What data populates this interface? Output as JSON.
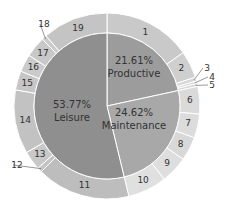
{
  "chart_data": {
    "type": "pie",
    "subtype": "nested-donut",
    "title": "",
    "inner": {
      "labels": [
        "Productive",
        "Maintenance",
        "Leisure"
      ],
      "values": [
        21.61,
        24.62,
        53.77
      ],
      "display": [
        "21.61%",
        "24.62%",
        "53.77%"
      ],
      "colors": [
        "#9c9c9c",
        "#a8a8a8",
        "#8f8f8f"
      ]
    },
    "outer": {
      "labels": [
        "1",
        "2",
        "3",
        "4",
        "5",
        "6",
        "7",
        "8",
        "9",
        "10",
        "11",
        "12",
        "13",
        "14",
        "15",
        "16",
        "17",
        "18",
        "19"
      ],
      "start_deg": [
        0,
        55,
        72,
        74.5,
        76,
        77.8,
        95,
        110,
        125,
        142,
        166.4,
        225,
        228,
        240,
        280,
        292,
        303,
        316,
        319
      ],
      "end_deg": [
        55,
        72,
        74.5,
        76,
        77.8,
        95,
        110,
        125,
        142,
        166.4,
        225,
        228,
        240,
        280,
        292,
        303,
        316,
        319,
        360
      ],
      "colors": [
        "#c9c9c9",
        "#cfcfcf",
        "#d6d6d6",
        "#d6d6d6",
        "#d6d6d6",
        "#dadada",
        "#dcdcdc",
        "#d8d8d8",
        "#dedede",
        "#e0e0e0",
        "#bdbdbd",
        "#c4c4c4",
        "#c8c8c8",
        "#c2c2c2",
        "#c6c6c6",
        "#cbcbcb",
        "#c8c8c8",
        "#cccccc",
        "#c4c4c4"
      ]
    },
    "center": [
      107,
      106
    ],
    "radius_outer": 93,
    "radius_inner": 73,
    "legend": null
  }
}
